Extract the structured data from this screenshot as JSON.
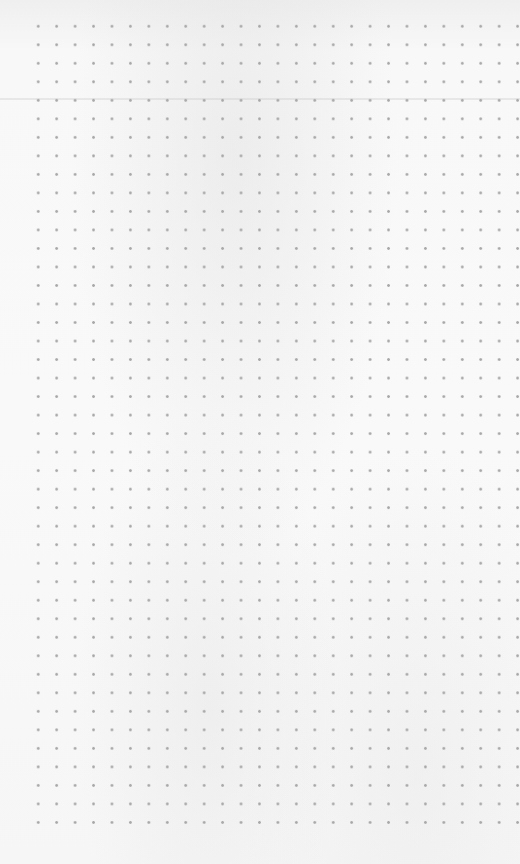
{
  "image": {
    "subject": "dot-grid paper sheet",
    "background_color": "#f7f7f7",
    "dot_color": "#a9a9a9",
    "grid": {
      "columns": 27,
      "rows": 44,
      "spacing_px": 18.5,
      "first_dot": [
        38,
        26
      ],
      "last_dot": [
        517,
        823
      ]
    }
  }
}
